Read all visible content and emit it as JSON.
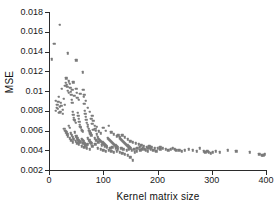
{
  "chart_data": {
    "type": "scatter",
    "title": "",
    "xlabel": "Kernel matrix size",
    "ylabel": "MSE",
    "xlim": [
      0,
      400
    ],
    "ylim": [
      0.002,
      0.018
    ],
    "xticks": [
      0,
      100,
      200,
      300,
      400
    ],
    "xticklabels": [
      "0",
      "100",
      "200",
      "300",
      "400"
    ],
    "yticks": [
      0.002,
      0.004,
      0.006,
      0.008,
      0.01,
      0.012,
      0.014,
      0.016,
      0.018
    ],
    "yticklabels": [
      "0.002",
      "0.004",
      "0.006",
      "0.008",
      "0.01",
      "0.012",
      "0.014",
      "0.016",
      "0.018"
    ],
    "grid": false,
    "legend": null,
    "marker_color": "#7a7a7a",
    "marker_size": 2.4,
    "series": [
      {
        "name": "MSE vs kernel matrix size",
        "points": [
          [
            5,
            0.0132
          ],
          [
            10,
            0.0148
          ],
          [
            20,
            0.0167
          ],
          [
            35,
            0.0138
          ],
          [
            50,
            0.0131
          ],
          [
            62,
            0.0119
          ],
          [
            13,
            0.009
          ],
          [
            15,
            0.0086
          ],
          [
            16,
            0.0082
          ],
          [
            18,
            0.0094
          ],
          [
            20,
            0.0084
          ],
          [
            21,
            0.0079
          ],
          [
            22,
            0.0088
          ],
          [
            24,
            0.0102
          ],
          [
            25,
            0.0081
          ],
          [
            26,
            0.0077
          ],
          [
            27,
            0.0092
          ],
          [
            28,
            0.0062
          ],
          [
            29,
            0.0086
          ],
          [
            30,
            0.0105
          ],
          [
            31,
            0.0108
          ],
          [
            32,
            0.0113
          ],
          [
            33,
            0.0106
          ],
          [
            34,
            0.0104
          ],
          [
            35,
            0.01
          ],
          [
            36,
            0.0098
          ],
          [
            37,
            0.011
          ],
          [
            38,
            0.0107
          ],
          [
            39,
            0.0103
          ],
          [
            40,
            0.0099
          ],
          [
            41,
            0.0096
          ],
          [
            42,
            0.0091
          ],
          [
            43,
            0.0088
          ],
          [
            44,
            0.0079
          ],
          [
            45,
            0.0076
          ],
          [
            46,
            0.0073
          ],
          [
            47,
            0.0071
          ],
          [
            48,
            0.007
          ],
          [
            49,
            0.0068
          ],
          [
            50,
            0.0102
          ],
          [
            51,
            0.0098
          ],
          [
            52,
            0.0093
          ],
          [
            53,
            0.0078
          ],
          [
            54,
            0.0075
          ],
          [
            55,
            0.0072
          ],
          [
            56,
            0.0069
          ],
          [
            57,
            0.0066
          ],
          [
            58,
            0.0064
          ],
          [
            59,
            0.0063
          ],
          [
            60,
            0.0061
          ],
          [
            61,
            0.006
          ],
          [
            62,
            0.0059
          ],
          [
            63,
            0.0101
          ],
          [
            64,
            0.0094
          ],
          [
            65,
            0.0087
          ],
          [
            66,
            0.008
          ],
          [
            67,
            0.0077
          ],
          [
            68,
            0.0074
          ],
          [
            69,
            0.0071
          ],
          [
            70,
            0.0068
          ],
          [
            71,
            0.0066
          ],
          [
            72,
            0.0064
          ],
          [
            73,
            0.0062
          ],
          [
            74,
            0.006
          ],
          [
            75,
            0.0058
          ],
          [
            76,
            0.0057
          ],
          [
            77,
            0.0056
          ],
          [
            78,
            0.0055
          ],
          [
            30,
            0.006
          ],
          [
            32,
            0.0058
          ],
          [
            34,
            0.0056
          ],
          [
            36,
            0.0065
          ],
          [
            38,
            0.0063
          ],
          [
            40,
            0.0057
          ],
          [
            42,
            0.0055
          ],
          [
            44,
            0.0053
          ],
          [
            46,
            0.0051
          ],
          [
            48,
            0.0058
          ],
          [
            50,
            0.0054
          ],
          [
            52,
            0.0052
          ],
          [
            54,
            0.005
          ],
          [
            56,
            0.0049
          ],
          [
            58,
            0.0048
          ],
          [
            60,
            0.0051
          ],
          [
            62,
            0.005
          ],
          [
            64,
            0.0049
          ],
          [
            66,
            0.0047
          ],
          [
            68,
            0.0046
          ],
          [
            70,
            0.0045
          ],
          [
            72,
            0.0052
          ],
          [
            74,
            0.005
          ],
          [
            76,
            0.0048
          ],
          [
            78,
            0.0047
          ],
          [
            80,
            0.0075
          ],
          [
            82,
            0.007
          ],
          [
            84,
            0.0065
          ],
          [
            86,
            0.006
          ],
          [
            88,
            0.0056
          ],
          [
            90,
            0.0053
          ],
          [
            92,
            0.0051
          ],
          [
            94,
            0.005
          ],
          [
            96,
            0.0049
          ],
          [
            98,
            0.0048
          ],
          [
            100,
            0.0047
          ],
          [
            102,
            0.0046
          ],
          [
            104,
            0.0045
          ],
          [
            106,
            0.0044
          ],
          [
            108,
            0.0052
          ],
          [
            110,
            0.0051
          ],
          [
            112,
            0.005
          ],
          [
            114,
            0.0049
          ],
          [
            116,
            0.0048
          ],
          [
            118,
            0.0047
          ],
          [
            120,
            0.0046
          ],
          [
            122,
            0.0045
          ],
          [
            124,
            0.0044
          ],
          [
            126,
            0.0043
          ],
          [
            128,
            0.0055
          ],
          [
            130,
            0.0053
          ],
          [
            132,
            0.0051
          ],
          [
            134,
            0.005
          ],
          [
            136,
            0.0049
          ],
          [
            138,
            0.0048
          ],
          [
            140,
            0.0047
          ],
          [
            142,
            0.0046
          ],
          [
            144,
            0.0045
          ],
          [
            146,
            0.0044
          ],
          [
            148,
            0.0043
          ],
          [
            150,
            0.0042
          ],
          [
            85,
            0.0062
          ],
          [
            88,
            0.0064
          ],
          [
            92,
            0.0059
          ],
          [
            95,
            0.0057
          ],
          [
            100,
            0.0063
          ],
          [
            105,
            0.006
          ],
          [
            110,
            0.0065
          ],
          [
            115,
            0.0058
          ],
          [
            120,
            0.0056
          ],
          [
            125,
            0.0054
          ],
          [
            130,
            0.0052
          ],
          [
            135,
            0.0055
          ],
          [
            140,
            0.0053
          ],
          [
            145,
            0.0051
          ],
          [
            150,
            0.0049
          ],
          [
            155,
            0.0048
          ],
          [
            160,
            0.0047
          ],
          [
            165,
            0.0046
          ],
          [
            170,
            0.0045
          ],
          [
            175,
            0.0044
          ],
          [
            180,
            0.0043
          ],
          [
            185,
            0.0044
          ],
          [
            190,
            0.0043
          ],
          [
            195,
            0.0042
          ],
          [
            200,
            0.0042
          ],
          [
            205,
            0.0041
          ],
          [
            90,
            0.0042
          ],
          [
            95,
            0.0041
          ],
          [
            100,
            0.004
          ],
          [
            105,
            0.0039
          ],
          [
            110,
            0.004
          ],
          [
            115,
            0.0039
          ],
          [
            120,
            0.0038
          ],
          [
            125,
            0.0039
          ],
          [
            130,
            0.0038
          ],
          [
            135,
            0.0037
          ],
          [
            140,
            0.0036
          ],
          [
            145,
            0.0035
          ],
          [
            150,
            0.0033
          ],
          [
            155,
            0.003
          ],
          [
            158,
            0.0038
          ],
          [
            162,
            0.0039
          ],
          [
            168,
            0.004
          ],
          [
            172,
            0.0041
          ],
          [
            178,
            0.004
          ],
          [
            182,
            0.0039
          ],
          [
            188,
            0.0041
          ],
          [
            192,
            0.004
          ],
          [
            198,
            0.0039
          ],
          [
            205,
            0.0043
          ],
          [
            210,
            0.0042
          ],
          [
            215,
            0.0041
          ],
          [
            220,
            0.004
          ],
          [
            225,
            0.0041
          ],
          [
            228,
            0.0042
          ],
          [
            232,
            0.0041
          ],
          [
            235,
            0.004
          ],
          [
            240,
            0.004
          ],
          [
            245,
            0.0039
          ],
          [
            250,
            0.004
          ],
          [
            258,
            0.0041
          ],
          [
            265,
            0.004
          ],
          [
            272,
            0.0039
          ],
          [
            278,
            0.0042
          ],
          [
            285,
            0.0039
          ],
          [
            288,
            0.0038
          ],
          [
            292,
            0.0039
          ],
          [
            295,
            0.0038
          ],
          [
            298,
            0.0037
          ],
          [
            302,
            0.0038
          ],
          [
            308,
            0.0039
          ],
          [
            315,
            0.0038
          ],
          [
            330,
            0.004
          ],
          [
            345,
            0.0039
          ],
          [
            370,
            0.0038
          ],
          [
            388,
            0.0036
          ],
          [
            392,
            0.0035
          ],
          [
            395,
            0.0035
          ],
          [
            398,
            0.0036
          ],
          [
            12,
            0.008
          ],
          [
            14,
            0.0083
          ],
          [
            17,
            0.0089
          ],
          [
            19,
            0.0078
          ],
          [
            23,
            0.0085
          ],
          [
            43,
            0.0101
          ],
          [
            45,
            0.0109
          ],
          [
            47,
            0.0095
          ],
          [
            55,
            0.0091
          ],
          [
            58,
            0.0097
          ],
          [
            65,
            0.0096
          ],
          [
            68,
            0.009
          ],
          [
            72,
            0.0083
          ],
          [
            75,
            0.0079
          ],
          [
            78,
            0.0072
          ],
          [
            80,
            0.0067
          ],
          [
            82,
            0.0061
          ],
          [
            60,
            0.0044
          ],
          [
            65,
            0.0043
          ],
          [
            70,
            0.0042
          ],
          [
            75,
            0.0041
          ],
          [
            80,
            0.0044
          ],
          [
            85,
            0.0046
          ],
          [
            63,
            0.0047
          ],
          [
            67,
            0.0045
          ],
          [
            71,
            0.0046
          ],
          [
            55,
            0.0046
          ],
          [
            52,
            0.0047
          ],
          [
            49,
            0.0049
          ],
          [
            44,
            0.0048
          ],
          [
            41,
            0.005
          ],
          [
            38,
            0.0052
          ],
          [
            35,
            0.0054
          ],
          [
            84,
            0.0052
          ],
          [
            87,
            0.005
          ],
          [
            91,
            0.0048
          ],
          [
            97,
            0.0045
          ],
          [
            103,
            0.0044
          ],
          [
            107,
            0.0043
          ],
          [
            113,
            0.0042
          ],
          [
            117,
            0.0043
          ],
          [
            123,
            0.0042
          ],
          [
            127,
            0.0041
          ],
          [
            133,
            0.0042
          ],
          [
            137,
            0.0041
          ],
          [
            143,
            0.004
          ],
          [
            147,
            0.0041
          ],
          [
            153,
            0.004
          ],
          [
            157,
            0.0041
          ],
          [
            163,
            0.0042
          ],
          [
            167,
            0.0043
          ],
          [
            173,
            0.0042
          ],
          [
            177,
            0.0041
          ],
          [
            183,
            0.0042
          ],
          [
            187,
            0.0043
          ]
        ]
      }
    ]
  }
}
